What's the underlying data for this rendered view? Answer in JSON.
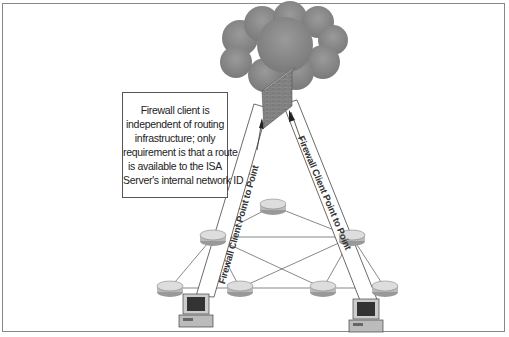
{
  "diagram": {
    "callout": {
      "lines": [
        "Firewall client is",
        "independent of routing",
        "infrastructure;  only",
        "requirement is that a route",
        "is available to the ISA",
        "Server's internal network ID"
      ]
    },
    "left_path_label": "Firewall Client Point to Point",
    "right_path_label": "Firewall Client Point to Point",
    "nodes": {
      "cloud": "internet-cloud",
      "firewall": "isa-server-firewall",
      "routers": 7,
      "clients": 2
    },
    "colors": {
      "cloud": "#8a8a8a",
      "firewall": "#7d7d7d",
      "router": "#c8c8c8",
      "line": "#555555",
      "frame": "#888888"
    }
  }
}
